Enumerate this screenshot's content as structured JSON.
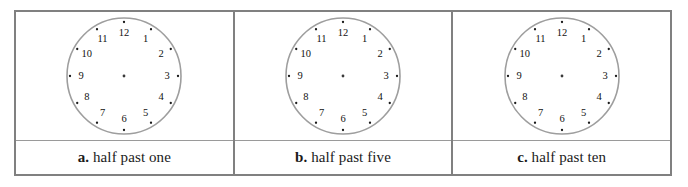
{
  "worksheet": {
    "cells": [
      {
        "id": "cell-a",
        "letter": "a.",
        "prompt": "half past one",
        "clock": {
          "name": "clock-face-a",
          "hour_numbers": [
            "1",
            "2",
            "3",
            "4",
            "5",
            "6",
            "7",
            "8",
            "9",
            "10",
            "11",
            "12"
          ],
          "has_hour_hand": false,
          "has_minute_hand": false,
          "has_center_dot": true,
          "minute_tick_count": 12,
          "ring_color": "#9e9e9e",
          "face_color": "#ffffff"
        }
      },
      {
        "id": "cell-b",
        "letter": "b.",
        "prompt": "half past five",
        "clock": {
          "name": "clock-face-b",
          "hour_numbers": [
            "1",
            "2",
            "3",
            "4",
            "5",
            "6",
            "7",
            "8",
            "9",
            "10",
            "11",
            "12"
          ],
          "has_hour_hand": false,
          "has_minute_hand": false,
          "has_center_dot": true,
          "minute_tick_count": 12,
          "ring_color": "#9e9e9e",
          "face_color": "#ffffff"
        }
      },
      {
        "id": "cell-c",
        "letter": "c.",
        "prompt": "half past ten",
        "clock": {
          "name": "clock-face-c",
          "hour_numbers": [
            "1",
            "2",
            "3",
            "4",
            "5",
            "6",
            "7",
            "8",
            "9",
            "10",
            "11",
            "12"
          ],
          "has_hour_hand": false,
          "has_minute_hand": false,
          "has_center_dot": true,
          "minute_tick_count": 12,
          "ring_color": "#9e9e9e",
          "face_color": "#ffffff"
        }
      }
    ],
    "border_color": "#808080",
    "divider_color": "#9a9a9a",
    "background_color": "#ffffff"
  }
}
